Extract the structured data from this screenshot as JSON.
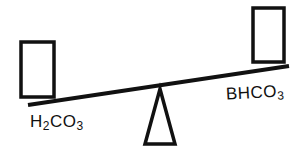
{
  "diagram": {
    "type": "seesaw-balance",
    "colors": {
      "stroke": "#111111",
      "background": "#ffffff"
    },
    "left": {
      "label_main_1": "H",
      "label_sub_1": "2",
      "label_main_2": "CO",
      "label_sub_2": "3",
      "full_label": "H2CO3",
      "position": "lower"
    },
    "right": {
      "label_main": "BHCO",
      "label_sub": "3",
      "full_label": "BHCO3",
      "position": "higher"
    }
  }
}
